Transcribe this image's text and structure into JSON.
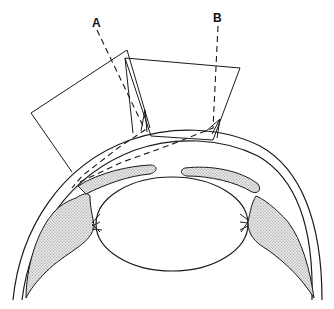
{
  "diagram": {
    "labels": {
      "ray_a": "A",
      "ray_b": "B"
    },
    "colors": {
      "line": "#1a1a1a",
      "background": "#ffffff",
      "stipple": "#9a9a9a"
    },
    "elements": [
      {
        "name": "mirror-prism-left",
        "kind": "outline"
      },
      {
        "name": "mirror-prism-center",
        "kind": "outline"
      },
      {
        "name": "ray-a",
        "kind": "dashed-line",
        "label": "A"
      },
      {
        "name": "ray-b",
        "kind": "dashed-line",
        "label": "B"
      },
      {
        "name": "cornea",
        "kind": "arc"
      },
      {
        "name": "iris-left",
        "kind": "stippled-band"
      },
      {
        "name": "iris-right",
        "kind": "stippled-band"
      },
      {
        "name": "lens",
        "kind": "ellipse"
      },
      {
        "name": "ciliary-body-left",
        "kind": "stippled-region"
      },
      {
        "name": "ciliary-body-right",
        "kind": "stippled-region"
      },
      {
        "name": "zonules-left",
        "kind": "lines"
      },
      {
        "name": "zonules-right",
        "kind": "lines"
      },
      {
        "name": "sclera",
        "kind": "arc"
      }
    ]
  }
}
